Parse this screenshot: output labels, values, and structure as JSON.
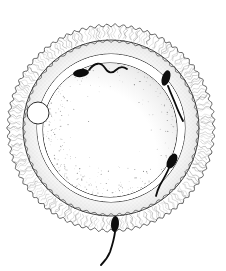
{
  "figure": {
    "title": "Human ovum surrounded by spermatozoa",
    "type": "scientific-line-illustration",
    "canvas": {
      "width": 226,
      "height": 271,
      "background": "#ffffff"
    },
    "ink_color": "#1a1a1a",
    "line_color": "#333333",
    "hatch_color": "#555555",
    "stipple_color": "#6b6b6b"
  },
  "structures": [
    {
      "id": "corona-radiata",
      "label": "Corona radiata",
      "shape": "scalloped-ring",
      "center": {
        "cx": 111,
        "cy": 128
      },
      "outer_radius": 104,
      "inner_radius": 88,
      "scallop_count": 78,
      "scallop_depth": 2.6,
      "fill": "#ffffff",
      "stroke": "#3a3a3a",
      "stroke_width": 0.8
    },
    {
      "id": "zona-pellucida",
      "label": "Zona pellucida",
      "shape": "ring",
      "center": {
        "cx": 111,
        "cy": 128
      },
      "outer_radius": 88,
      "inner_radius": 74,
      "fill": "#ffffff",
      "stroke": "#2e2e2e",
      "stroke_width": 0.9
    },
    {
      "id": "perivitelline-space",
      "label": "Perivitelline space",
      "shape": "ring",
      "center": {
        "cx": 111,
        "cy": 128
      },
      "outer_radius": 74,
      "inner_radius": 67,
      "fill": "#ffffff",
      "stroke": "#262626",
      "stroke_width": 0.9
    },
    {
      "id": "vitellus",
      "label": "Vitellus (ooplasm)",
      "shape": "circle",
      "center": {
        "cx": 110,
        "cy": 130
      },
      "radius": 67,
      "fill": "#ffffff",
      "stroke": "#1f1f1f",
      "stroke_width": 1.0,
      "shading": "stippled-crescent-lower-left"
    },
    {
      "id": "polar-body",
      "label": "Polar body",
      "shape": "circle",
      "center": {
        "cx": 38,
        "cy": 113
      },
      "radius": 11,
      "fill": "#ffffff",
      "stroke": "#2b2b2b",
      "stroke_width": 1.0
    }
  ],
  "spermatozoa": [
    {
      "id": "sperm-top",
      "label": "Spermatozoon at upper pole",
      "head_center": {
        "x": 81,
        "y": 73
      },
      "head_rx": 8,
      "head_ry": 4,
      "head_rotation_deg": -8,
      "tail_path": "M 89 70 C 95 62, 101 62, 105 68 C 108 73, 112 74, 116 70 C 119 67, 123 66, 127 69",
      "tail_width": 1.8,
      "color": "#0d0d0d"
    },
    {
      "id": "sperm-upper-right",
      "label": "Spermatozoon at upper right",
      "head_center": {
        "x": 166,
        "y": 78
      },
      "head_rx": 4,
      "head_ry": 8,
      "head_rotation_deg": 18,
      "tail_path": "M 168 86 C 171 94, 174 100, 177 108 C 179 113, 181 117, 183 121",
      "tail_width": 1.9,
      "color": "#0d0d0d"
    },
    {
      "id": "sperm-lower-right",
      "label": "Spermatozoon at lower right",
      "head_center": {
        "x": 172,
        "y": 161
      },
      "head_rx": 4.5,
      "head_ry": 8,
      "head_rotation_deg": 28,
      "tail_path": "M 169 168 C 166 175, 163 180, 160 185 C 158 189, 157 192, 156 196",
      "tail_width": 1.8,
      "color": "#0d0d0d"
    },
    {
      "id": "sperm-bottom",
      "label": "Spermatozoon at lower pole",
      "head_center": {
        "x": 115,
        "y": 224
      },
      "head_rx": 4,
      "head_ry": 8,
      "head_rotation_deg": 4,
      "tail_path": "M 115 232 C 114 240, 112 246, 110 252 C 108 257, 105 261, 101 265",
      "tail_width": 1.9,
      "color": "#0d0d0d"
    }
  ],
  "shading": {
    "corona_hatch_strokes": 220,
    "zona_stipple_dots": 420,
    "vitellus_stipple_dots": 900
  }
}
